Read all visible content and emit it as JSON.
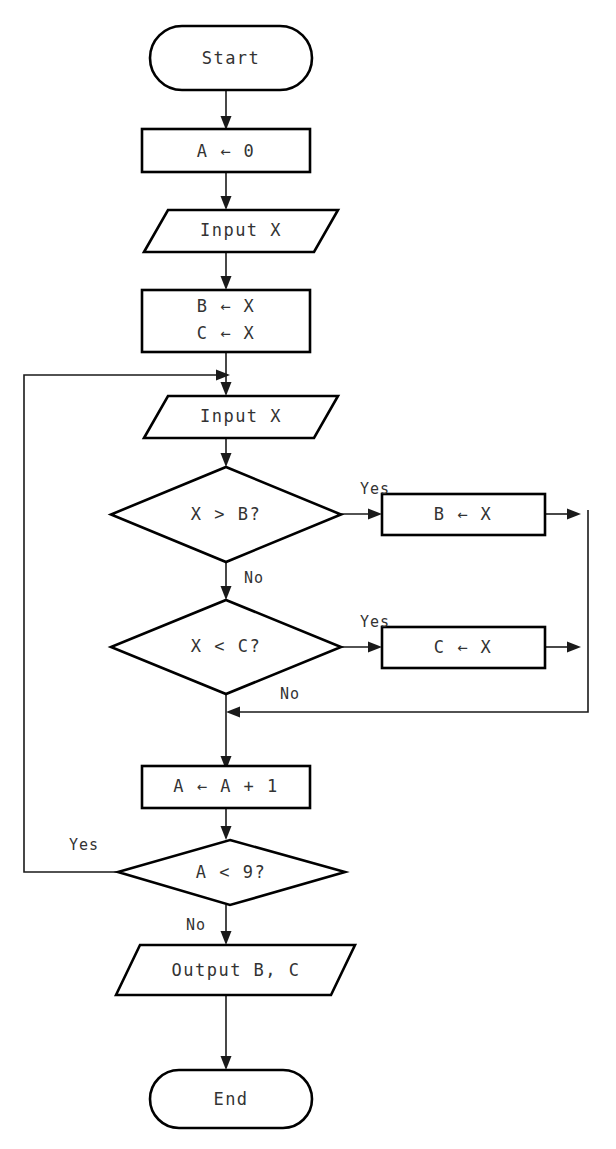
{
  "diagram": {
    "type": "flowchart",
    "background_color": "#ffffff",
    "stroke_color": "#000000",
    "text_color": "#333333",
    "nodes": [
      {
        "id": "start",
        "shape": "terminator",
        "label": "Start"
      },
      {
        "id": "init_a",
        "shape": "process",
        "label": "A ← 0"
      },
      {
        "id": "input1",
        "shape": "input_output",
        "label": "Input X"
      },
      {
        "id": "init_bc",
        "shape": "process",
        "line1": "B ← X",
        "line2": "C ← X"
      },
      {
        "id": "input2",
        "shape": "input_output",
        "label": "Input X"
      },
      {
        "id": "cond_xb",
        "shape": "decision",
        "label": "X > B?"
      },
      {
        "id": "set_b",
        "shape": "process",
        "label": "B ← X"
      },
      {
        "id": "cond_xc",
        "shape": "decision",
        "label": "X < C?"
      },
      {
        "id": "set_c",
        "shape": "process",
        "label": "C ← X"
      },
      {
        "id": "incr_a",
        "shape": "process",
        "label": "A ← A + 1"
      },
      {
        "id": "cond_a9",
        "shape": "decision",
        "label": "A < 9?"
      },
      {
        "id": "output",
        "shape": "input_output",
        "label": "Output B, C"
      },
      {
        "id": "end",
        "shape": "terminator",
        "label": "End"
      }
    ],
    "edge_labels": {
      "xb_yes": "Yes",
      "xb_no": "No",
      "xc_yes": "Yes",
      "xc_no": "No",
      "a9_yes": "Yes",
      "a9_no": "No"
    },
    "edges": [
      {
        "from": "start",
        "to": "init_a",
        "label": ""
      },
      {
        "from": "init_a",
        "to": "input1",
        "label": ""
      },
      {
        "from": "input1",
        "to": "init_bc",
        "label": ""
      },
      {
        "from": "init_bc",
        "to": "input2",
        "label": ""
      },
      {
        "from": "input2",
        "to": "cond_xb",
        "label": ""
      },
      {
        "from": "cond_xb",
        "to": "set_b",
        "label": "Yes"
      },
      {
        "from": "cond_xb",
        "to": "cond_xc",
        "label": "No"
      },
      {
        "from": "cond_xc",
        "to": "set_c",
        "label": "Yes"
      },
      {
        "from": "cond_xc",
        "to": "incr_a",
        "label": "No"
      },
      {
        "from": "set_b",
        "to": "incr_a",
        "label": ""
      },
      {
        "from": "set_c",
        "to": "incr_a",
        "label": ""
      },
      {
        "from": "incr_a",
        "to": "cond_a9",
        "label": ""
      },
      {
        "from": "cond_a9",
        "to": "input2",
        "label": "Yes"
      },
      {
        "from": "cond_a9",
        "to": "output",
        "label": "No"
      },
      {
        "from": "output",
        "to": "end",
        "label": ""
      }
    ]
  }
}
